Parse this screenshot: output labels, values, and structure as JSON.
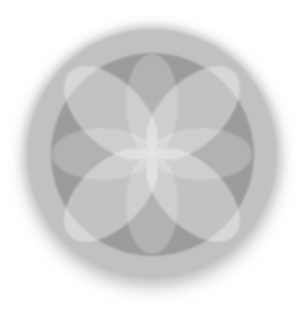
{
  "figure": {
    "background_color": "#ffffff",
    "center_x": 152,
    "center_y": 154,
    "outer_circle": {
      "color": "#c4c4c4",
      "diameter": 250
    },
    "inner_circle": {
      "color": "#9e9e9e",
      "diameter": 203
    },
    "axis_petals": {
      "count": 4,
      "angles_deg": [
        0,
        90,
        180,
        270
      ],
      "length": 100,
      "width": 52,
      "fill": "rgba(255,255,255,0.24)"
    },
    "diagonal_petals": {
      "count": 4,
      "angles_deg": [
        45,
        135,
        225,
        315
      ],
      "length": 116,
      "width": 64,
      "fill": "rgba(255,255,255,0.40)"
    }
  }
}
